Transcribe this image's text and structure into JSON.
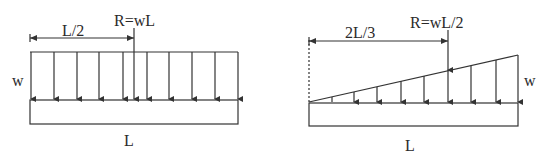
{
  "colors": {
    "stroke": "#333333",
    "text": "#2a2a2a",
    "background": "#ffffff"
  },
  "uniform_load": {
    "resultant_label": "R=wL",
    "distance_label": "L/2",
    "intensity_label": "w",
    "length_label": "L",
    "arrow_count": 10
  },
  "triangular_load": {
    "resultant_label": "R=wL/2",
    "distance_label": "2L/3",
    "intensity_label": "w",
    "length_label": "L",
    "arrow_count": 9
  }
}
